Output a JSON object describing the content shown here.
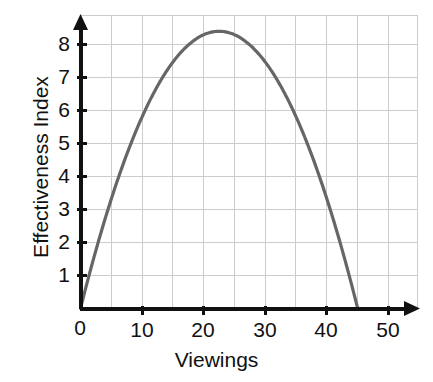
{
  "chart_data": {
    "type": "line",
    "title": "",
    "subtitle": "",
    "xlabel": "Viewings",
    "ylabel": "Effectiveness Index",
    "xlim": [
      0,
      55
    ],
    "ylim": [
      0,
      8.8
    ],
    "xticks": [
      0,
      10,
      20,
      30,
      40,
      50
    ],
    "xtick_labels": [
      "0",
      "10",
      "20",
      "30",
      "40",
      "50"
    ],
    "yticks": [
      1,
      2,
      3,
      4,
      5,
      6,
      7,
      8
    ],
    "ytick_labels": [
      "1",
      "2",
      "3",
      "4",
      "5",
      "6",
      "7",
      "8"
    ],
    "grid": true,
    "grid_x_step": 5,
    "grid_y_step": 1,
    "legend": false,
    "legend_position": "none",
    "curve_color": "#666666",
    "axis_color": "#111111",
    "grid_color": "#cccccc",
    "annotations": [],
    "series": [
      {
        "name": "Effectiveness Index",
        "shape": "parabola",
        "roots": [
          0,
          45
        ],
        "vertex_x": 22.5,
        "vertex_y": 8.4,
        "x": [
          0,
          2.5,
          5,
          7.5,
          10,
          12.5,
          15,
          17.5,
          20,
          22.5,
          25,
          27.5,
          30,
          32.5,
          35,
          37.5,
          40,
          42.5,
          45
        ],
        "values": [
          0,
          1.77,
          3.32,
          4.67,
          5.81,
          6.74,
          7.47,
          7.99,
          8.3,
          8.4,
          8.3,
          7.99,
          7.47,
          6.74,
          5.81,
          4.67,
          3.32,
          1.77,
          0
        ]
      }
    ]
  },
  "axes": {
    "x_title": "Viewings",
    "y_title": "Effectiveness Index",
    "x_tick_labels": [
      "0",
      "10",
      "20",
      "30",
      "40",
      "50"
    ],
    "y_tick_labels": [
      "1",
      "2",
      "3",
      "4",
      "5",
      "6",
      "7",
      "8"
    ]
  }
}
